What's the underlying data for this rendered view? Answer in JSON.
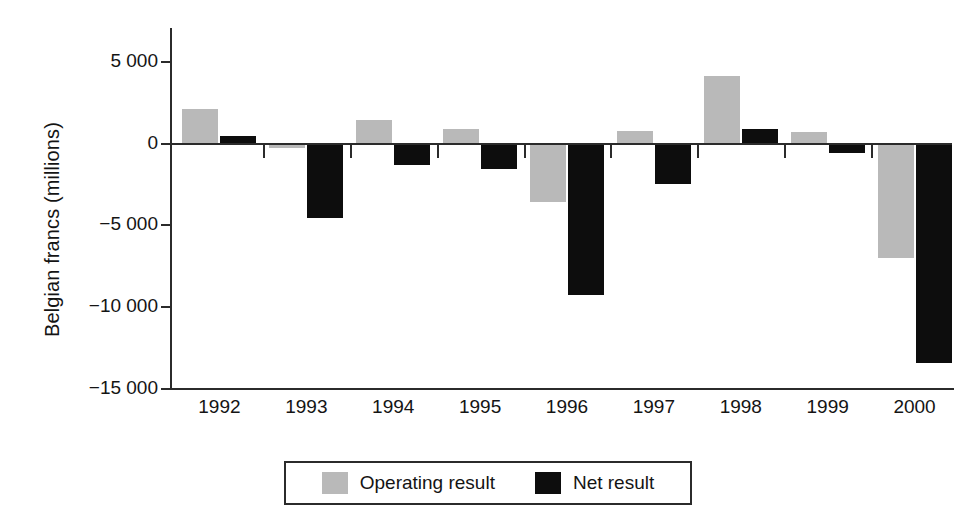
{
  "chart_data": {
    "type": "bar",
    "title": "",
    "subtitle": "",
    "xlabel": "",
    "ylabel": "Belgian francs (millions)",
    "categories": [
      "1992",
      "1993",
      "1994",
      "1995",
      "1996",
      "1997",
      "1998",
      "1999",
      "2000"
    ],
    "series": [
      {
        "name": "Operating result",
        "color": "#b9b9b9",
        "values": [
          2050,
          -350,
          1400,
          850,
          -3650,
          700,
          4050,
          650,
          -7050
        ]
      },
      {
        "name": "Net result",
        "color": "#0d0d0d",
        "values": [
          420,
          -4600,
          -1350,
          -1600,
          -9300,
          -2550,
          800,
          -650,
          -13500
        ]
      }
    ],
    "ylim": [
      -15000,
      7000
    ],
    "yticks": [
      5000,
      0,
      -5000,
      -10000,
      -15000
    ],
    "ytick_labels": [
      "5 000",
      "0",
      "−5 000",
      "−10 000",
      "−15 000"
    ],
    "grid": false,
    "legend_position": "bottom-center",
    "axis_color": "#2b2b2b",
    "background": "#ffffff"
  },
  "legend": {
    "entries": [
      {
        "label": "Operating result",
        "swatch": "operating-result-swatch"
      },
      {
        "label": "Net result",
        "swatch": "net-result-swatch"
      }
    ]
  }
}
